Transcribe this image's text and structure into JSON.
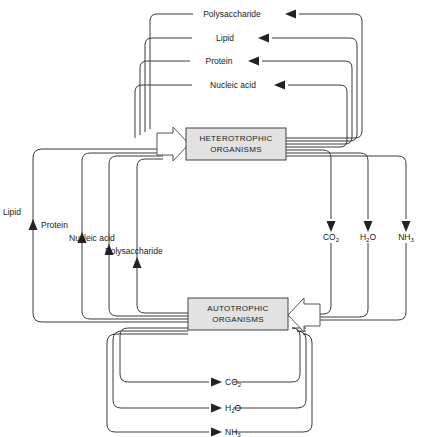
{
  "diagram": {
    "background_color": "#ffffff",
    "line_color": "#3a3a3a",
    "box_fill_color": "#e2e2e2",
    "box_stroke_color": "#444444",
    "boxes": [
      {
        "id": "heterotrophic",
        "line1": "HETEROTROPHIC",
        "line2": "ORGANISMS"
      },
      {
        "id": "autotrophic",
        "line1": "AUTOTROPHIC",
        "line2": "ORGANISMS"
      }
    ],
    "top_outputs": [
      {
        "label": "Polysaccharide"
      },
      {
        "label": "Lipid"
      },
      {
        "label": "Protein"
      },
      {
        "label": "Nucleic acid"
      }
    ],
    "left_outputs": [
      {
        "label": "Lipid"
      },
      {
        "label": "Protein"
      },
      {
        "label": "Nucleic acid"
      },
      {
        "label": "Polysaccharide"
      }
    ],
    "right_outputs": [
      {
        "base": "CO",
        "subscript": "2"
      },
      {
        "base": "H",
        "subscript": "2",
        "tail": "O"
      },
      {
        "base": "NH",
        "subscript": "3"
      }
    ],
    "bottom_outputs": [
      {
        "base": "CO",
        "subscript": "2"
      },
      {
        "base": "H",
        "subscript": "2",
        "tail": "O"
      },
      {
        "base": "NH",
        "subscript": "3"
      }
    ]
  }
}
